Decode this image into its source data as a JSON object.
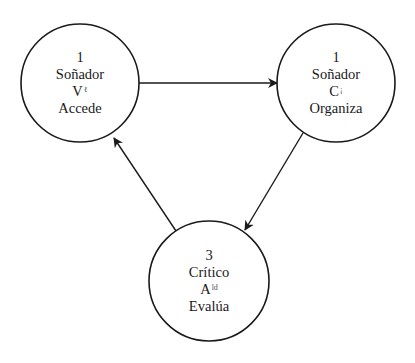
{
  "diagram": {
    "type": "cycle",
    "nodes": [
      {
        "id": "node-1",
        "number": "1",
        "role": "Soñador",
        "letter": "V",
        "letter_mark": "ℓ",
        "action": "Accede",
        "cx": 80,
        "cy": 83,
        "r": 59
      },
      {
        "id": "node-2",
        "number": "1",
        "role": "Soñador",
        "letter": "C",
        "letter_mark": "¡",
        "action": "Organiza",
        "cx": 336,
        "cy": 83,
        "r": 59
      },
      {
        "id": "node-3",
        "number": "3",
        "role": "Crítico",
        "letter": "A",
        "letter_mark": "ld",
        "action": "Evalúa",
        "cx": 209,
        "cy": 281,
        "r": 60
      }
    ],
    "edges": [
      {
        "from": "node-1",
        "to": "node-2",
        "x1": 139,
        "y1": 83,
        "x2": 277,
        "y2": 83
      },
      {
        "from": "node-2",
        "to": "node-3",
        "x1": 303,
        "y1": 133,
        "x2": 245,
        "y2": 230
      },
      {
        "from": "node-3",
        "to": "node-1",
        "x1": 176,
        "y1": 231,
        "x2": 114,
        "y2": 138
      }
    ],
    "colors": {
      "stroke": "#1a1a1a",
      "background": "#ffffff"
    }
  }
}
